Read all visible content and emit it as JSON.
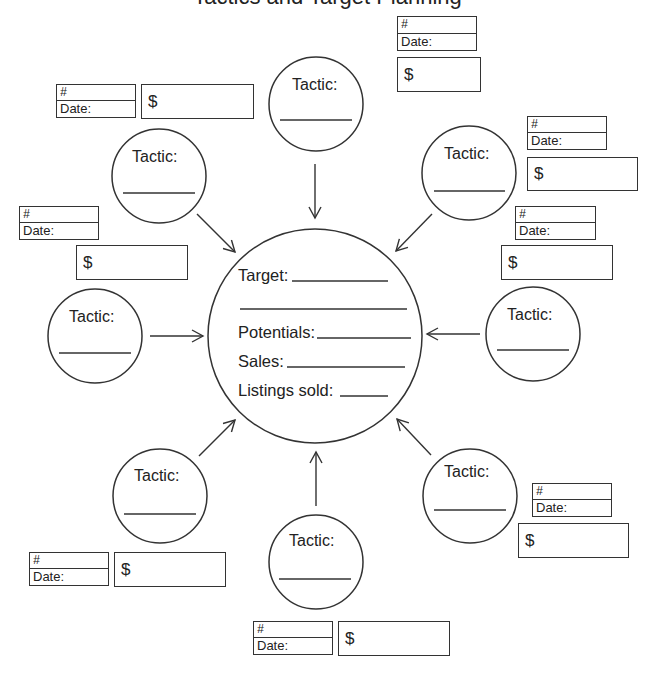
{
  "title_fragment": "Tactics and Target Planning",
  "center_hub": {
    "fields": [
      {
        "label": "Target:",
        "value": ""
      },
      {
        "label": "",
        "value": ""
      },
      {
        "label": "Potentials:",
        "value": ""
      },
      {
        "label": "Sales:",
        "value": ""
      },
      {
        "label": "Listings sold:",
        "value": ""
      }
    ]
  },
  "tactic_label": "Tactic:",
  "num_label": "#",
  "date_label": "Date:",
  "dollar_label": "$",
  "tactics": [
    {
      "position": "top",
      "label": "Tactic:",
      "value": ""
    },
    {
      "position": "top-left",
      "label": "Tactic:",
      "value": ""
    },
    {
      "position": "top-right",
      "label": "Tactic:",
      "value": ""
    },
    {
      "position": "left",
      "label": "Tactic:",
      "value": ""
    },
    {
      "position": "right",
      "label": "Tactic:",
      "value": ""
    },
    {
      "position": "bottom-left",
      "label": "Tactic:",
      "value": ""
    },
    {
      "position": "bottom",
      "label": "Tactic:",
      "value": ""
    },
    {
      "position": "bottom-right",
      "label": "Tactic:",
      "value": ""
    }
  ],
  "tracking_boxes": [
    {
      "for": "top",
      "num_label": "#",
      "date_label": "Date:",
      "dollar_label": "$"
    },
    {
      "for": "top-left",
      "num_label": "#",
      "date_label": "Date:",
      "dollar_label": "$"
    },
    {
      "for": "top-right",
      "num_label": "#",
      "date_label": "Date:",
      "dollar_label": "$"
    },
    {
      "for": "left",
      "num_label": "#",
      "date_label": "Date:",
      "dollar_label": "$"
    },
    {
      "for": "right",
      "num_label": "#",
      "date_label": "Date:",
      "dollar_label": "$"
    },
    {
      "for": "bottom-left",
      "num_label": "#",
      "date_label": "Date:",
      "dollar_label": "$"
    },
    {
      "for": "bottom",
      "num_label": "#",
      "date_label": "Date:",
      "dollar_label": "$"
    },
    {
      "for": "bottom-right",
      "num_label": "#",
      "date_label": "Date:",
      "dollar_label": "$"
    }
  ],
  "colors": {
    "line": "#333333",
    "text": "#222222",
    "background": "#ffffff"
  }
}
